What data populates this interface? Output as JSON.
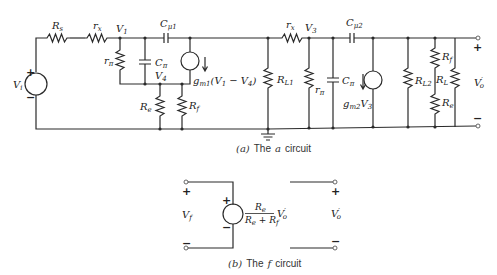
{
  "figure": {
    "circuit_a": {
      "caption_prefix": "(a)",
      "caption_text": "The",
      "caption_italic": "a",
      "caption_suffix": "circuit",
      "components": {
        "source_vi": {
          "label": "V",
          "sub": "i",
          "plus": "+",
          "minus": "−"
        },
        "rs": {
          "label": "R",
          "sub": "s"
        },
        "rx1": {
          "label": "r",
          "sub": "x"
        },
        "node_v1": {
          "label": "V",
          "sub": "1"
        },
        "rpi1": {
          "label": "r",
          "sub": "π"
        },
        "cpi1": {
          "label": "C",
          "sub": "π"
        },
        "cmu1": {
          "label": "C",
          "sub": "μ1"
        },
        "gm1": {
          "label": "g",
          "sub": "m1",
          "expr": "(V",
          "expr_sub1": "1",
          "expr_mid": " − V",
          "expr_sub2": "4",
          "expr_end": ")"
        },
        "node_v4": {
          "label": "V",
          "sub": "4"
        },
        "re1": {
          "label": "R",
          "sub": "e"
        },
        "rf1": {
          "label": "R",
          "sub": "f"
        },
        "rl1": {
          "label": "R",
          "sub": "L1"
        },
        "rx2": {
          "label": "r",
          "sub": "x"
        },
        "node_v3": {
          "label": "V",
          "sub": "3"
        },
        "rpi2": {
          "label": "r",
          "sub": "π"
        },
        "cpi2": {
          "label": "C",
          "sub": "π"
        },
        "cmu2": {
          "label": "C",
          "sub": "μ2"
        },
        "gm2": {
          "label": "g",
          "sub": "m2",
          "expr": "V",
          "expr_sub": "3"
        },
        "rl2": {
          "label": "R",
          "sub": "L2"
        },
        "rf2": {
          "label": "R",
          "sub": "f"
        },
        "re2": {
          "label": "R",
          "sub": "e"
        },
        "rl": {
          "label": "R",
          "sub": "L"
        },
        "output": {
          "label": "V",
          "sub": "o",
          "prime": "′",
          "plus": "+",
          "minus": "−"
        }
      }
    },
    "circuit_f": {
      "caption_prefix": "(b)",
      "caption_text": "The",
      "caption_italic": "f",
      "caption_suffix": "circuit",
      "input": {
        "label": "V",
        "sub": "f",
        "plus": "+",
        "minus": "−"
      },
      "source": {
        "plus": "+",
        "minus": "−",
        "num": "R",
        "num_sub": "e",
        "den1": "R",
        "den1_sub": "e",
        "den_plus": " + ",
        "den2": "R",
        "den2_sub": "f",
        "var": "V",
        "var_sub": "o",
        "var_prime": "′"
      },
      "output": {
        "label": "V",
        "sub": "o",
        "prime": "′",
        "plus": "+",
        "minus": "−"
      }
    }
  }
}
